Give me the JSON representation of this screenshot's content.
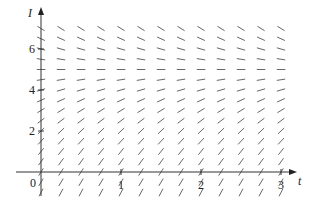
{
  "chart_data": {
    "type": "slope_field",
    "title": "",
    "xlabel": "t",
    "ylabel": "I",
    "xlim": [
      0,
      3.25
    ],
    "ylim": [
      -1.2,
      7.5
    ],
    "x_ticks": [
      0,
      0.25,
      0.5,
      0.75,
      1,
      1.25,
      1.5,
      1.75,
      2,
      2.25,
      2.5,
      2.75,
      3
    ],
    "x_tick_labels": [
      {
        "value": 1,
        "label": "1"
      },
      {
        "value": 2,
        "label": "2"
      },
      {
        "value": 3,
        "label": "3"
      }
    ],
    "y_tick_labels": [
      {
        "value": 2,
        "label": "2"
      },
      {
        "value": 4,
        "label": "4"
      },
      {
        "value": 6,
        "label": "6"
      }
    ],
    "origin_label": "0",
    "grid_t": [
      0,
      0.25,
      0.5,
      0.75,
      1,
      1.25,
      1.5,
      1.75,
      2,
      2.25,
      2.5,
      2.75,
      3
    ],
    "grid_I": [
      -1,
      -0.5,
      0,
      0.5,
      1,
      1.5,
      2,
      2.5,
      3,
      3.5,
      4,
      4.5,
      5,
      5.5,
      6,
      6.5,
      7
    ],
    "equilibrium": 5,
    "slope_description": "Slopes depend only on I: positive and steep for I below 5, flattening toward horizontal at I = 5, negative above 5 (dI/dt proportional to 5 - I)",
    "slope_function": {
      "form": "k*(5 - I)",
      "k": 1.2
    },
    "grid": false,
    "legend": null
  }
}
